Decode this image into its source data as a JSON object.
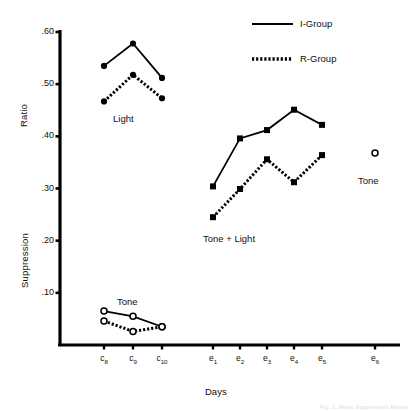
{
  "figure": {
    "y_axis_label_top": "Ratio",
    "y_axis_label_bottom": "Suppression",
    "x_axis_label": "Days",
    "y_ticks": [
      ".60",
      ".50",
      ".40",
      ".30",
      ".20",
      ".10"
    ],
    "y_tick_values": [
      0.6,
      0.5,
      0.4,
      0.3,
      0.2,
      0.1
    ],
    "x_ticks": [
      "c8",
      "c9",
      "c10",
      "e1",
      "e2",
      "e3",
      "e4",
      "e5",
      "e6"
    ],
    "x_tick_main": [
      "c",
      "c",
      "c",
      "e",
      "e",
      "e",
      "e",
      "e",
      "e"
    ],
    "x_tick_sub": [
      "8",
      "9",
      "10",
      "1",
      "2",
      "3",
      "4",
      "5",
      "6"
    ],
    "legend": [
      {
        "label": "I-Group",
        "style": "solid"
      },
      {
        "label": "R-Group",
        "style": "dotted"
      }
    ],
    "annotations": [
      {
        "text": "Light",
        "x": 118,
        "y": 118
      },
      {
        "text": "Tone",
        "x": 121,
        "y": 300
      },
      {
        "text": "Tone + Light",
        "x": 205,
        "y": 238
      },
      {
        "text": "Tone",
        "x": 360,
        "y": 180
      }
    ],
    "corner_artifact": "Fig. 2. Mean Suppression Ratios"
  },
  "chart_data": {
    "type": "line",
    "title": "",
    "xlabel": "Days",
    "ylabel": "Suppression Ratio",
    "ylim": [
      0.0,
      0.6
    ],
    "grid": false,
    "legend_position": "top-right",
    "categories": [
      "c8",
      "c9",
      "c10",
      "e1",
      "e2",
      "e3",
      "e4",
      "e5",
      "e6"
    ],
    "groups": [
      {
        "name": "Light",
        "marker": "filled-circle",
        "series": [
          {
            "name": "I-Group",
            "style": "solid",
            "x": [
              "c8",
              "c9",
              "c10"
            ],
            "values": [
              0.535,
              0.578,
              0.512
            ]
          },
          {
            "name": "R-Group",
            "style": "dotted",
            "x": [
              "c8",
              "c9",
              "c10"
            ],
            "values": [
              0.467,
              0.518,
              0.473
            ]
          }
        ]
      },
      {
        "name": "Tone",
        "marker": "open-circle",
        "series": [
          {
            "name": "I-Group",
            "style": "solid",
            "x": [
              "c8",
              "c9",
              "c10"
            ],
            "values": [
              0.065,
              0.055,
              0.035
            ]
          },
          {
            "name": "R-Group",
            "style": "dotted",
            "x": [
              "c8",
              "c9",
              "c10"
            ],
            "values": [
              0.046,
              0.026,
              0.035
            ]
          }
        ]
      },
      {
        "name": "Tone + Light",
        "marker": "filled-square",
        "series": [
          {
            "name": "I-Group",
            "style": "solid",
            "x": [
              "e1",
              "e2",
              "e3",
              "e4",
              "e5"
            ],
            "values": [
              0.304,
              0.396,
              0.412,
              0.451,
              0.422
            ]
          },
          {
            "name": "R-Group",
            "style": "dotted",
            "x": [
              "e1",
              "e2",
              "e3",
              "e4",
              "e5"
            ],
            "values": [
              0.245,
              0.299,
              0.356,
              0.312,
              0.364
            ]
          }
        ]
      },
      {
        "name": "Tone (test)",
        "marker": "open-circle",
        "series": [
          {
            "name": "I-Group",
            "style": "none",
            "x": [
              "e6"
            ],
            "values": [
              0.368
            ]
          }
        ]
      }
    ]
  },
  "geometry": {
    "axis_x": 60,
    "axis_y_top": 30,
    "axis_y_bottom": 345,
    "axis_x_right": 400,
    "y_top_value": 0.6,
    "y_top_px": 32,
    "y_zero_px": 345,
    "x_positions": {
      "c8": 104,
      "c9": 133,
      "c10": 162,
      "e1": 213,
      "e2": 240,
      "e3": 267,
      "e4": 294,
      "e5": 322,
      "e6": 375
    }
  }
}
